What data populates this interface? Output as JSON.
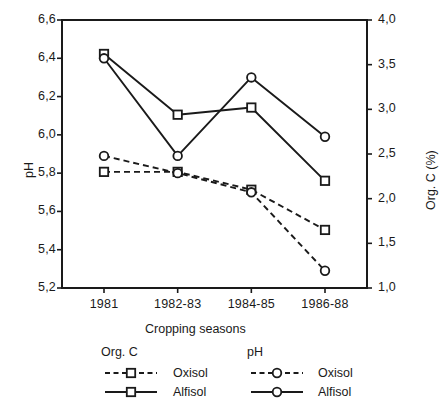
{
  "chart_data": {
    "type": "line",
    "title": "",
    "xlabel": "Cropping seasons",
    "ylabel": "pH",
    "y2label": "Org. C (%)",
    "categories": [
      "1981",
      "1982-83",
      "1984-85",
      "1986-88"
    ],
    "ylim": [
      5.2,
      6.6
    ],
    "y2lim": [
      1.0,
      4.0
    ],
    "yticks": [
      "5,2",
      "5,4",
      "5,6",
      "5,8",
      "6,0",
      "6,2",
      "6,4",
      "6,6"
    ],
    "ytick_values": [
      5.2,
      5.4,
      5.6,
      5.8,
      6.0,
      6.2,
      6.4,
      6.6
    ],
    "y2ticks": [
      "1,0",
      "1,5",
      "2,0",
      "2,5",
      "3,0",
      "3,5",
      "4,0"
    ],
    "y2tick_values": [
      1.0,
      1.5,
      2.0,
      2.5,
      3.0,
      3.5,
      4.0
    ],
    "grid": false,
    "legend_position": "below",
    "series": [
      {
        "name": "Org. C Oxisol",
        "group": "Org. C",
        "soil": "Oxisol",
        "axis": "right",
        "marker": "square",
        "linestyle": "dashed",
        "values": [
          2.3,
          2.3,
          2.1,
          1.65
        ]
      },
      {
        "name": "Org. C Alfisol",
        "group": "Org. C",
        "soil": "Alfisol",
        "axis": "right",
        "marker": "square",
        "linestyle": "solid",
        "values": [
          3.62,
          2.94,
          3.02,
          2.2
        ]
      },
      {
        "name": "pH Oxisol",
        "group": "pH",
        "soil": "Oxisol",
        "axis": "left",
        "marker": "circle",
        "linestyle": "dashed",
        "values": [
          5.89,
          5.8,
          5.7,
          5.29
        ]
      },
      {
        "name": "pH Alfisol",
        "group": "pH",
        "soil": "Alfisol",
        "axis": "left",
        "marker": "circle",
        "linestyle": "solid",
        "values": [
          6.4,
          5.89,
          6.3,
          5.99
        ]
      }
    ]
  },
  "legend": {
    "group_orgc": "Org. C",
    "group_ph": "pH",
    "orgc_oxisol": "Oxisol",
    "orgc_alfisol": "Alfisol",
    "ph_oxisol": "Oxisol",
    "ph_alfisol": "Alfisol"
  },
  "colors": {
    "line": "#1a1a1a",
    "axis": "#1a1a1a",
    "background": "#ffffff",
    "marker_fill": "#ffffff"
  }
}
